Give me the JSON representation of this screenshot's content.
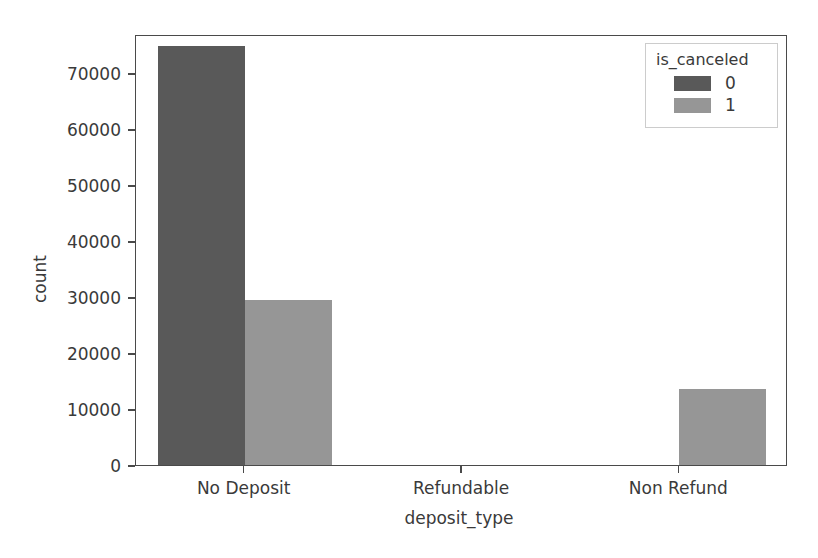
{
  "chart_data": {
    "type": "bar",
    "title": "",
    "xlabel": "deposit_type",
    "ylabel": "count",
    "categories": [
      "No Deposit",
      "Refundable",
      "Non Refund"
    ],
    "series": [
      {
        "name": "0",
        "color": "#595959",
        "values": [
          74800,
          0,
          0
        ]
      },
      {
        "name": "1",
        "color": "#969696",
        "values": [
          29500,
          0,
          13600
        ]
      }
    ],
    "legend": {
      "title": "is_canceled",
      "position": "upper right",
      "entries": [
        {
          "label": "0",
          "color": "#595959"
        },
        {
          "label": "1",
          "color": "#969696"
        }
      ]
    },
    "ylim": [
      0,
      77000
    ],
    "yticks": [
      0,
      10000,
      20000,
      30000,
      40000,
      50000,
      60000,
      70000
    ],
    "ytick_labels": [
      "0",
      "10000",
      "20000",
      "30000",
      "40000",
      "50000",
      "60000",
      "70000"
    ],
    "grid": false,
    "axis_color": "#4a4a4a"
  }
}
